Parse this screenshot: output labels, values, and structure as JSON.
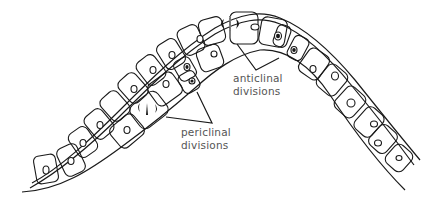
{
  "figure": {
    "type": "line-drawing",
    "colors": {
      "line": "#1a1a1a",
      "label_text": "#555555",
      "background": "#ffffff"
    }
  },
  "labels": {
    "anticlinal": {
      "line1": "anticlinal",
      "line2": "divisions"
    },
    "periclinal": {
      "line1": "periclinal",
      "line2": "divisions"
    }
  }
}
